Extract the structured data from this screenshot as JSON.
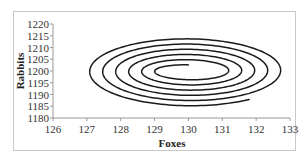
{
  "chart_data": {
    "type": "line",
    "title": "",
    "xlabel": "Foxes",
    "ylabel": "Rabbits",
    "xlim": [
      126,
      133
    ],
    "ylim": [
      1180,
      1220
    ],
    "x_ticks": [
      126,
      127,
      128,
      129,
      130,
      131,
      132,
      133
    ],
    "y_ticks": [
      1180,
      1185,
      1190,
      1195,
      1200,
      1205,
      1210,
      1215,
      1220
    ],
    "grid": false,
    "legend": null,
    "series": [
      {
        "name": "Foxes vs Rabbits (phase trajectory)",
        "shape": "outward spiral",
        "center": {
          "x": 130.0,
          "y": 1200.0
        },
        "start": {
          "x": 130.0,
          "y": 1202.5
        },
        "end": {
          "x": 132.5,
          "y": 1212.0
        },
        "loop_left_extremes_x": [
          128.8,
          128.3,
          128.0,
          127.7,
          127.4,
          127.0
        ],
        "loop_right_extremes_x": [
          131.1,
          131.6,
          132.0,
          132.3,
          132.6
        ],
        "outer_y_range": [
          1185.5,
          1215.5
        ],
        "turns": 5.6,
        "color": "#1a1a1a"
      }
    ]
  }
}
